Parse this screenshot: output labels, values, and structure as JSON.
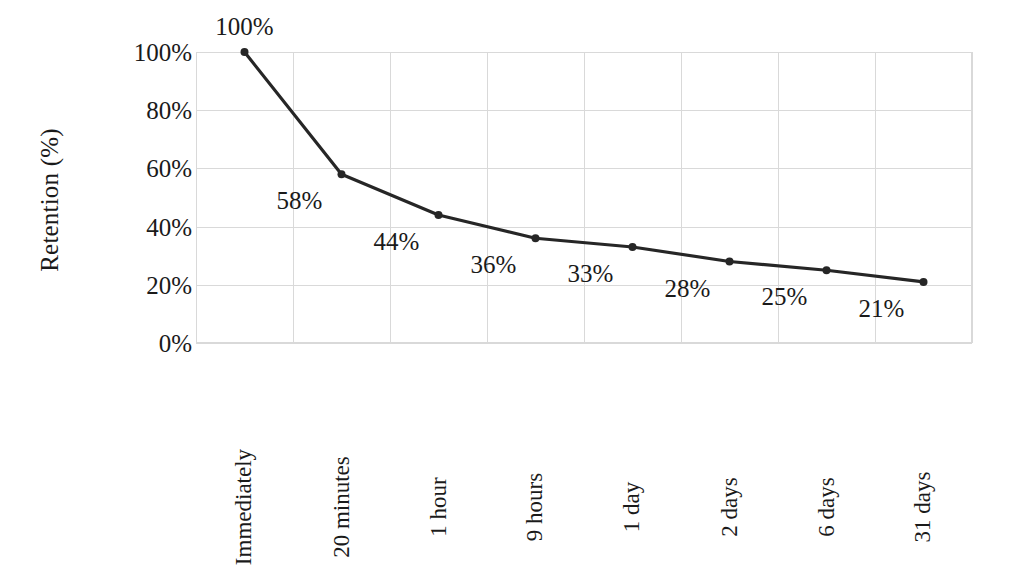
{
  "chart_data": {
    "type": "line",
    "title": "",
    "xlabel": "",
    "ylabel": "Retention (%)",
    "categories": [
      "Immediately",
      "20 minutes",
      "1 hour",
      "9 hours",
      "1 day",
      "2 days",
      "6 days",
      "31 days"
    ],
    "values": [
      100,
      58,
      44,
      36,
      33,
      28,
      25,
      21
    ],
    "point_labels": [
      "100%",
      "58%",
      "44%",
      "36%",
      "33%",
      "28%",
      "25%",
      "21%"
    ],
    "ylim": [
      0,
      100
    ],
    "y_ticks": [
      0,
      20,
      40,
      60,
      80,
      100
    ],
    "y_tick_labels": [
      "0%",
      "20%",
      "40%",
      "60%",
      "80%",
      "100%"
    ],
    "grid": true,
    "legend": "none",
    "series_color": "#262626",
    "grid_color": "#d9d9d9",
    "background_color": "#ffffff",
    "marker": "circle"
  }
}
